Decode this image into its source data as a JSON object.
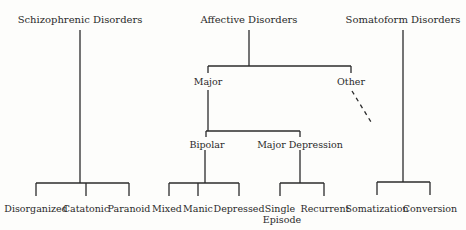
{
  "diagram": {
    "type": "taxonomy-tree",
    "line_color": "#2b2b2b",
    "text_color": "#2a2a2a",
    "nodes": {
      "schizophrenic": {
        "label": "Schizophrenic Disorders",
        "children": {
          "disorganized": "Disorganized",
          "catatonic": "Catatonic",
          "paranoid": "Paranoid"
        }
      },
      "affective": {
        "label": "Affective Disorders",
        "major": {
          "label": "Major",
          "bipolar": {
            "label": "Bipolar",
            "children": {
              "mixed": "Mixed",
              "manic": "Manic",
              "depressed": "Depressed"
            }
          },
          "major_depression": {
            "label": "Major Depression",
            "children": {
              "single_episode_line1": "Single",
              "single_episode_line2": "Episode",
              "recurrent": "Recurrent"
            }
          }
        },
        "other": {
          "label": "Other",
          "continuation": "dashed"
        }
      },
      "somatoform": {
        "label": "Somatoform Disorders",
        "children": {
          "somatization": "Somatization",
          "conversion": "Conversion"
        }
      }
    }
  }
}
